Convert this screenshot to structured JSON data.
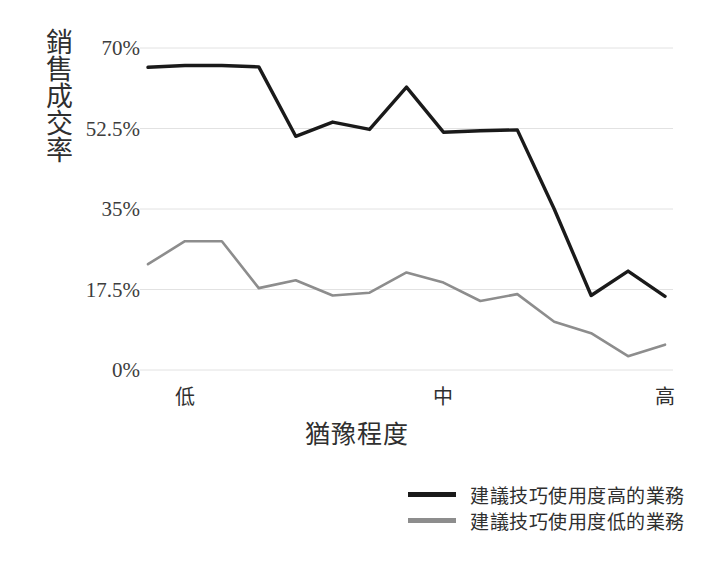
{
  "chart_data": {
    "type": "line",
    "title": "",
    "subtitle": "",
    "xlabel": "猶豫程度",
    "ylabel": "銷售成交率",
    "grid": true,
    "legend_position": "bottom-right",
    "ylim": [
      0,
      70
    ],
    "ytick_labels": [
      "70%",
      "52.5%",
      "35%",
      "17.5%",
      "0%"
    ],
    "ytick_values": [
      70,
      52.5,
      35,
      17.5,
      0
    ],
    "xtick_labels": [
      "低",
      "中",
      "高"
    ],
    "xtick_positions": [
      1,
      8,
      14
    ],
    "x": [
      1,
      2,
      3,
      4,
      5,
      6,
      7,
      8,
      9,
      10,
      11,
      12,
      13,
      14,
      15
    ],
    "series": [
      {
        "name": "建議技巧使用度高的業務",
        "color": "#1a1a1a",
        "values": [
          65.8,
          66.2,
          66.2,
          65.9,
          50.8,
          53.9,
          52.3,
          61.5,
          51.7,
          52.0,
          52.2,
          35.0,
          16.2,
          21.5,
          16.0
        ]
      },
      {
        "name": "建議技巧使用度低的業務",
        "color": "#8d8d8d",
        "values": [
          23.0,
          28.0,
          28.0,
          17.8,
          19.5,
          16.2,
          16.8,
          21.2,
          19.0,
          15.0,
          16.5,
          10.5,
          8.0,
          3.0,
          5.5
        ]
      }
    ]
  },
  "axes": {
    "y_title": "銷售成交率",
    "x_title": "猶豫程度"
  },
  "colors": {
    "series_high": "#1a1a1a",
    "series_low": "#8d8d8d",
    "gridline": "#e2e2e2",
    "text": "#2f2f2f"
  }
}
